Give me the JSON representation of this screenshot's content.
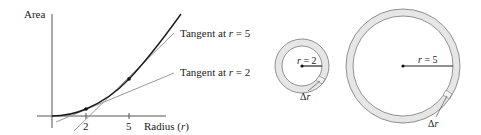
{
  "graph": {
    "y_axis_label": "Area",
    "x_axis_label_prefix": "Radius (",
    "x_axis_label_var": "r",
    "x_axis_label_suffix": ")",
    "ticks": [
      "2",
      "5"
    ],
    "tangent_labels": [
      {
        "prefix": "Tangent at ",
        "var": "r",
        "eq": " = 5"
      },
      {
        "prefix": "Tangent at ",
        "var": "r",
        "eq": " = 2"
      }
    ],
    "points": [
      {
        "r": 2
      },
      {
        "r": 5
      }
    ]
  },
  "circles": [
    {
      "radius_var": "r",
      "radius_eq": " = 2",
      "delta_label": "Δ",
      "delta_var": "r"
    },
    {
      "radius_var": "r",
      "radius_eq": " = 5",
      "delta_label": "Δ",
      "delta_var": "r"
    }
  ],
  "colors": {
    "curve": "#1a1a1a",
    "tangent": "#9a9a9a",
    "axis": "#555555",
    "ring_fill": "#e6e6e6",
    "ring_stroke": "#777777"
  }
}
